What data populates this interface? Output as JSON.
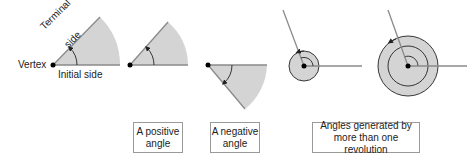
{
  "colors": {
    "fill": "#d4d4d4",
    "ray": "#8a8a8a",
    "spiral": "#222222",
    "vertex": "#000000",
    "box_border": "#9a9a9a"
  },
  "labels": {
    "vertex": "Vertex",
    "initial_side": "Initial side",
    "terminal_side_line1": "Terminal",
    "terminal_side_line2": "side"
  },
  "captions": {
    "positive": {
      "line1": "A positive",
      "line2": "angle"
    },
    "negative": {
      "line1": "A negative",
      "line2": "angle"
    },
    "revolution": {
      "line1": "Angles generated by",
      "line2": "more than one revolution"
    }
  },
  "figures": [
    {
      "id": "anatomy",
      "direction": "counterclockwise"
    },
    {
      "id": "positive",
      "direction": "counterclockwise"
    },
    {
      "id": "negative",
      "direction": "clockwise"
    },
    {
      "id": "one-plus-revolution",
      "direction": "counterclockwise"
    },
    {
      "id": "two-plus-revolutions",
      "direction": "counterclockwise"
    }
  ]
}
